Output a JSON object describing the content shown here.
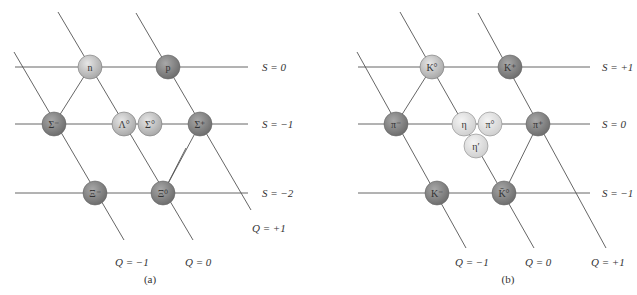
{
  "figure": {
    "panels": [
      {
        "caption": "(a)",
        "type": "baryon octet",
        "strangeness_labels": [
          "S = 0",
          "S = −1",
          "S = −2"
        ],
        "charge_labels": [
          "Q = −1",
          "Q = 0",
          "Q = +1"
        ],
        "particles": [
          {
            "label": "n",
            "S": 0,
            "Q": 0,
            "shade": "light"
          },
          {
            "label": "p",
            "S": 0,
            "Q": 1,
            "shade": "dark"
          },
          {
            "label": "Σ⁻",
            "S": -1,
            "Q": -1,
            "shade": "dark"
          },
          {
            "label": "Λ°",
            "S": -1,
            "Q": 0,
            "shade": "light"
          },
          {
            "label": "Σ°",
            "S": -1,
            "Q": 0,
            "shade": "light"
          },
          {
            "label": "Σ⁺",
            "S": -1,
            "Q": 1,
            "shade": "dark"
          },
          {
            "label": "Ξ⁻",
            "S": -2,
            "Q": -1,
            "shade": "dark"
          },
          {
            "label": "Ξ⁰",
            "S": -2,
            "Q": 0,
            "shade": "dark"
          }
        ]
      },
      {
        "caption": "(b)",
        "type": "meson nonet",
        "strangeness_labels": [
          "S = +1",
          "S = 0",
          "S = −1"
        ],
        "charge_labels": [
          "Q = −1",
          "Q = 0",
          "Q = +1"
        ],
        "particles": [
          {
            "label": "K°",
            "S": 1,
            "Q": 0,
            "shade": "light"
          },
          {
            "label": "K⁺",
            "S": 1,
            "Q": 1,
            "shade": "dark"
          },
          {
            "label": "π⁻",
            "S": 0,
            "Q": -1,
            "shade": "dark"
          },
          {
            "label": "η",
            "S": 0,
            "Q": 0,
            "shade": "pale"
          },
          {
            "label": "π°",
            "S": 0,
            "Q": 0,
            "shade": "pale"
          },
          {
            "label": "η′",
            "S": 0,
            "Q": 0,
            "shade": "pale"
          },
          {
            "label": "π⁺",
            "S": 0,
            "Q": 1,
            "shade": "dark"
          },
          {
            "label": "K⁻",
            "S": -1,
            "Q": -1,
            "shade": "dark"
          },
          {
            "label": "K̄°",
            "S": -1,
            "Q": 0,
            "shade": "dark"
          }
        ]
      }
    ]
  },
  "colors": {
    "line": "#555555",
    "light_fill": "#c8c8c8",
    "dark_fill": "#8a8a8a",
    "pale_fill": "#e4e4e4",
    "text": "#333333"
  }
}
